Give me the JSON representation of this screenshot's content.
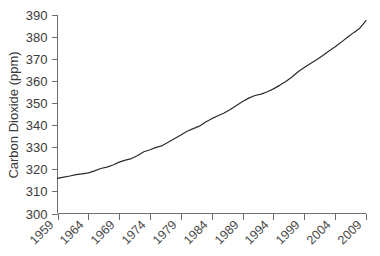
{
  "chart_data": {
    "type": "line",
    "title": "",
    "subtitle": "",
    "xlabel": "",
    "ylabel": "Carbon Dioxide (ppm)",
    "xlim": [
      1959,
      2009
    ],
    "ylim": [
      300,
      390
    ],
    "grid": false,
    "legend": "none",
    "y_ticks": [
      300,
      310,
      320,
      330,
      340,
      350,
      360,
      370,
      380,
      390
    ],
    "x_ticks": [
      1959,
      1964,
      1969,
      1974,
      1979,
      1984,
      1989,
      1994,
      1999,
      2004,
      2009
    ],
    "x_tick_labels": [
      "1959",
      "1964",
      "1969",
      "1974",
      "1979",
      "1984",
      "1989",
      "1994",
      "1999",
      "2004",
      "2009"
    ],
    "y_tick_labels": [
      "390",
      "380",
      "370",
      "360",
      "350",
      "340",
      "330",
      "320",
      "310",
      "300"
    ],
    "line_color": "#2b2b2b",
    "axis_color": "#6e6e6e",
    "series": [
      {
        "name": "Carbon Dioxide (ppm)",
        "x": [
          1959,
          1960,
          1961,
          1962,
          1963,
          1964,
          1965,
          1966,
          1967,
          1968,
          1969,
          1970,
          1971,
          1972,
          1973,
          1974,
          1975,
          1976,
          1977,
          1978,
          1979,
          1980,
          1981,
          1982,
          1983,
          1984,
          1985,
          1986,
          1987,
          1988,
          1989,
          1990,
          1991,
          1992,
          1993,
          1994,
          1995,
          1996,
          1997,
          1998,
          1999,
          2000,
          2001,
          2002,
          2003,
          2004,
          2005,
          2006,
          2007,
          2008,
          2009
        ],
        "values": [
          315.9,
          316.5,
          317.0,
          317.6,
          318.0,
          318.4,
          319.3,
          320.4,
          321.0,
          322.0,
          323.3,
          324.2,
          324.9,
          326.3,
          328.0,
          328.9,
          330.0,
          330.8,
          332.4,
          334.0,
          335.6,
          337.3,
          338.5,
          339.6,
          341.5,
          343.0,
          344.3,
          345.6,
          347.2,
          349.0,
          350.8,
          352.3,
          353.5,
          354.1,
          355.2,
          356.5,
          358.1,
          359.9,
          361.9,
          364.3,
          366.2,
          368.0,
          369.7,
          371.6,
          373.7,
          375.6,
          377.7,
          379.9,
          382.0,
          384.0,
          387.5
        ]
      }
    ]
  },
  "axis": {
    "y_label": "Carbon Dioxide (ppm)"
  }
}
